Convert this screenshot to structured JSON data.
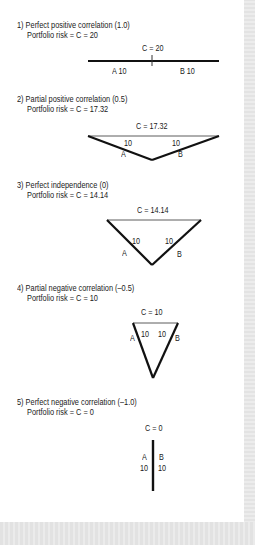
{
  "sections": [
    {
      "heading": "1) Perfect positive correlation (1.0)",
      "risk": "Portfolio risk = C = 20",
      "c_label": "C = 20",
      "a_label": "A 10",
      "b_label": "B 10",
      "correlation": 1.0,
      "portfolio_risk": 20
    },
    {
      "heading": "2) Partial positive correlation (0.5)",
      "risk": "Portfolio risk = C = 17.32",
      "c_label": "C = 17.32",
      "a_value": "10",
      "b_value": "10",
      "a_label": "A",
      "b_label": "B",
      "correlation": 0.5,
      "portfolio_risk": 17.32
    },
    {
      "heading": "3) Perfect independence (0)",
      "risk": "Portfolio risk = C = 14.14",
      "c_label": "C = 14.14",
      "a_value": "10",
      "b_value": "10",
      "a_label": "A",
      "b_label": "B",
      "correlation": 0,
      "portfolio_risk": 14.14
    },
    {
      "heading": "4) Partial negative correlation (–0.5)",
      "risk": "Portfolio risk = C = 10",
      "c_label": "C = 10",
      "a_value": "10",
      "b_value": "10",
      "a_label": "A",
      "b_label": "B",
      "correlation": -0.5,
      "portfolio_risk": 10
    },
    {
      "heading": "5) Perfect negative correlation (–1.0)",
      "risk": "Portfolio risk = C = 0",
      "c_label": "C = 0",
      "a_label": "A",
      "b_label": "B",
      "a_value": "10",
      "b_value": "10",
      "correlation": -1.0,
      "portfolio_risk": 0
    }
  ],
  "colors": {
    "ink": "#111111",
    "thin_line": "#333333",
    "frame": "#e6e6e6"
  }
}
